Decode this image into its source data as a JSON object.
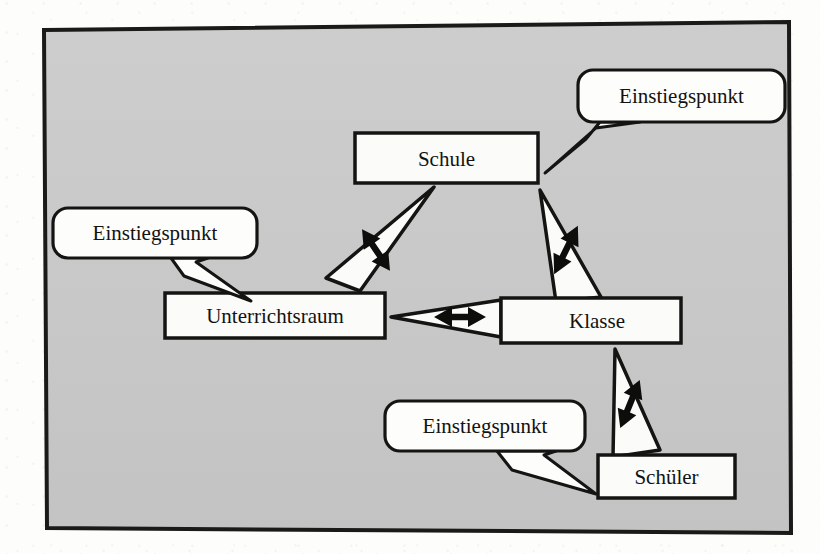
{
  "page": {
    "background_color": "#fdfdfb",
    "frame": {
      "name": "diagram-frame",
      "fill_color": "#c9c9c9",
      "stroke_color": "#1a1a18",
      "stroke_width": 4
    }
  },
  "showthrough_text": [
    {
      "text": "die faint verso text",
      "x": 120,
      "y": 70
    },
    {
      "text": "durchscheinender Text",
      "x": 180,
      "y": 210
    },
    {
      "text": "Die Objektorientierte Sicht",
      "x": 150,
      "y": 368
    },
    {
      "text": "wiederverwendbar",
      "x": 60,
      "y": 300
    },
    {
      "text": "Modellierung",
      "x": 520,
      "y": 200
    }
  ],
  "diagram": {
    "type": "uml-class-navigation-diagram",
    "nodes": [
      {
        "id": "schule",
        "name": "node-schule",
        "label": "Schule",
        "x": 355,
        "y": 133,
        "w": 183,
        "h": 50,
        "fill": "#fbfbf9",
        "stroke": "#141412"
      },
      {
        "id": "unterrichtsraum",
        "name": "node-unterrichtsraum",
        "label": "Unterrichtsraum",
        "x": 165,
        "y": 293,
        "w": 220,
        "h": 45,
        "fill": "#fbfbf9",
        "stroke": "#141412"
      },
      {
        "id": "klasse",
        "name": "node-klasse",
        "label": "Klasse",
        "x": 501,
        "y": 298,
        "w": 180,
        "h": 45,
        "fill": "#fbfbf9",
        "stroke": "#141412"
      },
      {
        "id": "schueler",
        "name": "node-schueler",
        "label": "Schüler",
        "x": 598,
        "y": 455,
        "w": 137,
        "h": 43,
        "fill": "#fbfbf9",
        "stroke": "#141412"
      }
    ],
    "connectors": [
      {
        "id": "schule-unterrichtsraum",
        "name": "connector-schule-unterrichtsraum",
        "from": "schule",
        "to": "unterrichtsraum",
        "kind": "bidirectional-wedge",
        "arrow_glyph": "double-arrow-vertical"
      },
      {
        "id": "schule-klasse",
        "name": "connector-schule-klasse",
        "from": "schule",
        "to": "klasse",
        "kind": "bidirectional-wedge",
        "arrow_glyph": "double-arrow-vertical"
      },
      {
        "id": "unterrichtsraum-klasse",
        "name": "connector-unterrichtsraum-klasse",
        "from": "klasse",
        "to": "unterrichtsraum",
        "kind": "bidirectional-wedge",
        "arrow_glyph": "double-arrow-horizontal"
      },
      {
        "id": "klasse-schueler",
        "name": "connector-klasse-schueler",
        "from": "klasse",
        "to": "schueler",
        "kind": "bidirectional-wedge",
        "arrow_glyph": "double-arrow-vertical"
      }
    ],
    "callouts": [
      {
        "id": "callout-schule",
        "name": "callout-einstiegspunkt-schule",
        "label": "Einstiegspunkt",
        "points_to": "schule",
        "x": 578,
        "y": 70,
        "w": 207,
        "h": 52,
        "radius": 14,
        "fill": "#fdfdfb",
        "stroke": "#141412",
        "tail_direction": "down-left"
      },
      {
        "id": "callout-unterrichtsraum",
        "name": "callout-einstiegspunkt-unterrichtsraum",
        "label": "Einstiegspunkt",
        "points_to": "unterrichtsraum",
        "x": 53,
        "y": 208,
        "w": 204,
        "h": 50,
        "radius": 14,
        "fill": "#fdfdfb",
        "stroke": "#141412",
        "tail_direction": "down-right"
      },
      {
        "id": "callout-schueler",
        "name": "callout-einstiegspunkt-schueler",
        "label": "Einstiegspunkt",
        "points_to": "schueler",
        "x": 385,
        "y": 401,
        "w": 200,
        "h": 50,
        "radius": 14,
        "fill": "#fdfdfb",
        "stroke": "#141412",
        "tail_direction": "down-right"
      }
    ]
  }
}
